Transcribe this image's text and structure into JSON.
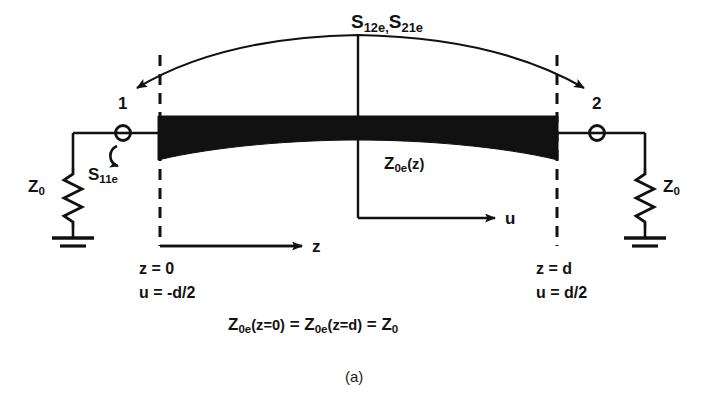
{
  "figure": {
    "caption": "(a)",
    "background_color": "#ffffff",
    "ink_color": "#111111",
    "taper_fill_color": "#111111"
  },
  "labels": {
    "s_transmission": {
      "base": "S",
      "sub": "12e,",
      "base2": "S",
      "sub2": "21e",
      "full": "S12e,S21e"
    },
    "s_reflection": {
      "base": "S",
      "sub": "11e",
      "full": "S11e"
    },
    "impedance_left": {
      "base": "Z",
      "sub": "0",
      "full": "Z0"
    },
    "impedance_right": {
      "base": "Z",
      "sub": "0",
      "full": "Z0"
    },
    "line_impedance": {
      "base": "Z",
      "sub": "0e",
      "arg": "(z)",
      "full": "Z0e(z)"
    },
    "axis_z": "z",
    "axis_u": "u",
    "port_1": "1",
    "port_2": "2",
    "left_plane_z": "z = 0",
    "left_plane_u": "u = -d/2",
    "right_plane_z": "z = d",
    "right_plane_u": "u = d/2",
    "boundary_equation": {
      "term1_base": "Z",
      "term1_sub": "0e",
      "term1_arg": "(z=0)",
      "eq1": " = ",
      "term2_base": "Z",
      "term2_sub": "0e",
      "term2_arg": "(z=d)",
      "eq2": " = ",
      "term3_base": "Z",
      "term3_sub": "0",
      "full": "Z0e(z=0) = Z0e(z=d) = Z0"
    }
  },
  "geometry": {
    "taper_left_x": 158,
    "taper_right_x": 558,
    "taper_top_y": 116,
    "taper_end_bottom_y": 160,
    "taper_mid_bottom_y": 140,
    "plane_left_x": 160,
    "plane_right_x": 557,
    "plane_top_y": 55,
    "plane_bottom_y": 246,
    "wire_y": 133,
    "node_left_x": 123,
    "node_right_x": 597,
    "center_x": 358,
    "arc_left_x": 131,
    "arc_right_x": 590,
    "arc_peak_y": 47
  },
  "icons": {
    "resistor": "resistor-zigzag-icon",
    "ground": "ground-symbol-icon",
    "node": "port-node-circle-icon",
    "arrow_double_arc": "double-headed-arc-arrow-icon",
    "arrow_loop": "reflection-loop-arrow-icon",
    "arrow_axis": "axis-arrowhead-icon"
  }
}
